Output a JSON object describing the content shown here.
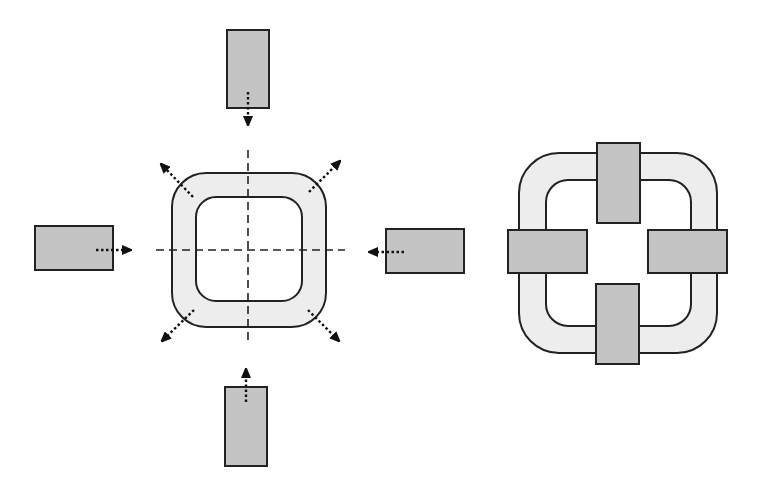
{
  "diagram": {
    "title": "",
    "colors": {
      "background": "#ffffff",
      "ring_fill": "#ededed",
      "block_fill": "#c4c4c4",
      "stroke": "#222222"
    },
    "left_figure": {
      "description": "Square ring with four rectangular blocks moving inward along dashed center axes; corner arrows point outward",
      "blocks": [
        "top",
        "left",
        "right",
        "bottom"
      ],
      "arrows_inward": 4,
      "arrows_outward_corners": 4
    },
    "right_figure": {
      "description": "Assembled state: four rectangular blocks placed on the square ring at top, left, right, bottom",
      "blocks": [
        "top",
        "left",
        "right",
        "bottom"
      ]
    }
  }
}
